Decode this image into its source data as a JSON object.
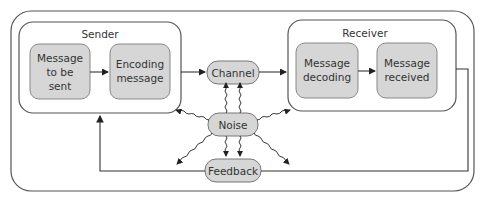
{
  "diagram": {
    "sender": {
      "title": "Sender",
      "box1": [
        "Message",
        "to be",
        "sent"
      ],
      "box2": [
        "Encoding",
        "message"
      ]
    },
    "receiver": {
      "title": "Receiver",
      "box1": [
        "Message",
        "decoding"
      ],
      "box2": [
        "Message",
        "received"
      ]
    },
    "channel": "Channel",
    "noise": "Noise",
    "feedback": "Feedback"
  },
  "colors": {
    "node_fill": "#d6d6d6",
    "stroke": "#444444"
  }
}
